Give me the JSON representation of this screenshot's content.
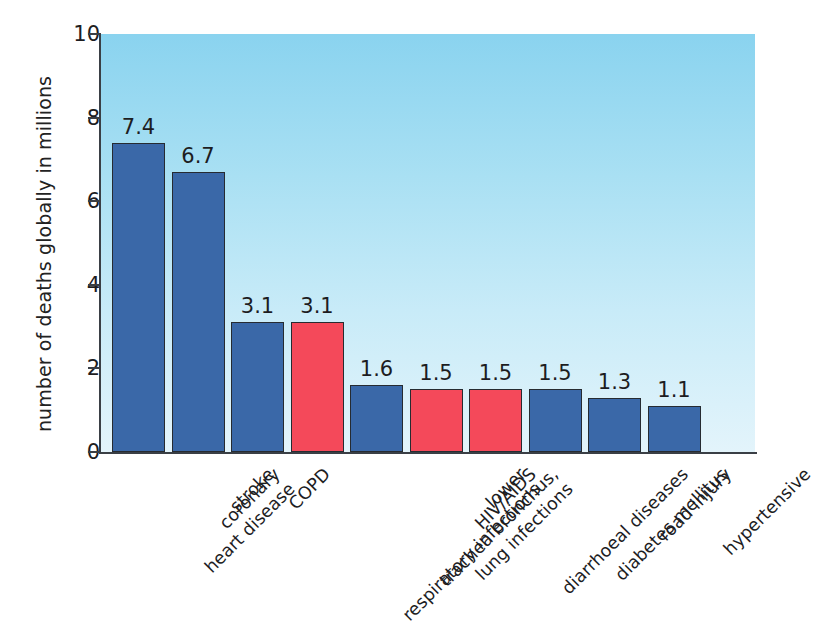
{
  "chart_data": {
    "type": "bar",
    "title": "",
    "xlabel": "",
    "ylabel": "number of deaths globally in millions",
    "ylim": [
      0,
      10
    ],
    "yticks": [
      "0",
      "2",
      "4",
      "6",
      "8",
      "10"
    ],
    "grid": false,
    "legend": "none",
    "categories": [
      "coronary heart disease",
      "stroke",
      "COPD",
      "lower respiratory infections",
      "trachea bronchus, lung infections",
      "HIV/AIDS",
      "diarrhoeal diseases",
      "diabetes mellitus",
      "road injury",
      "hypertensive"
    ],
    "category_lines": [
      [
        "coronary",
        "heart disease"
      ],
      [
        "stroke",
        ""
      ],
      [
        "COPD",
        ""
      ],
      [
        "lower",
        "respiratory infections"
      ],
      [
        "trachea bronchus,",
        "lung infections"
      ],
      [
        "HIV/AIDS",
        ""
      ],
      [
        "diarrhoeal diseases",
        ""
      ],
      [
        "diabetes mellitus",
        ""
      ],
      [
        "road injury",
        ""
      ],
      [
        "hypertensive",
        ""
      ]
    ],
    "values": [
      7.4,
      6.7,
      3.1,
      3.1,
      1.6,
      1.5,
      1.5,
      1.5,
      1.3,
      1.1
    ],
    "value_labels": [
      "7.4",
      "6.7",
      "3.1",
      "3.1",
      "1.6",
      "1.5",
      "1.5",
      "1.5",
      "1.3",
      "1.1"
    ],
    "bar_colors": [
      "#3a68a8",
      "#3a68a8",
      "#3a68a8",
      "#f4495a",
      "#3a68a8",
      "#f4495a",
      "#f4495a",
      "#3a68a8",
      "#3a68a8",
      "#3a68a8"
    ],
    "colors": {
      "blue": "#3a68a8",
      "red": "#f4495a",
      "bar_outline": "#262b31",
      "axis": "#3a3f45",
      "text": "#1d1d1f",
      "plot_bg_top": "#8ad3ef",
      "plot_bg_bottom": "#e3f4fb",
      "page_bg": "#ffffff"
    }
  }
}
